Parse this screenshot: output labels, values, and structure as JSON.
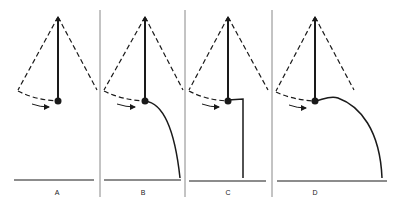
{
  "figure": {
    "panels": [
      {
        "id": "A",
        "label": "A",
        "pivot": [
          58,
          17
        ],
        "bob": [
          58,
          101
        ],
        "path": "none"
      },
      {
        "id": "B",
        "label": "B",
        "pivot": [
          145,
          17
        ],
        "bob": [
          145,
          101
        ],
        "path": "curve-fall"
      },
      {
        "id": "C",
        "label": "C",
        "pivot": [
          228,
          17
        ],
        "bob": [
          228,
          101
        ],
        "path": "right-angle-drop"
      },
      {
        "id": "D",
        "label": "D",
        "pivot": [
          315,
          17
        ],
        "bob": [
          315,
          101
        ],
        "path": "bump-then-fall"
      }
    ],
    "colors": {
      "line": "#1a1a1a",
      "divider": "#888888"
    }
  }
}
